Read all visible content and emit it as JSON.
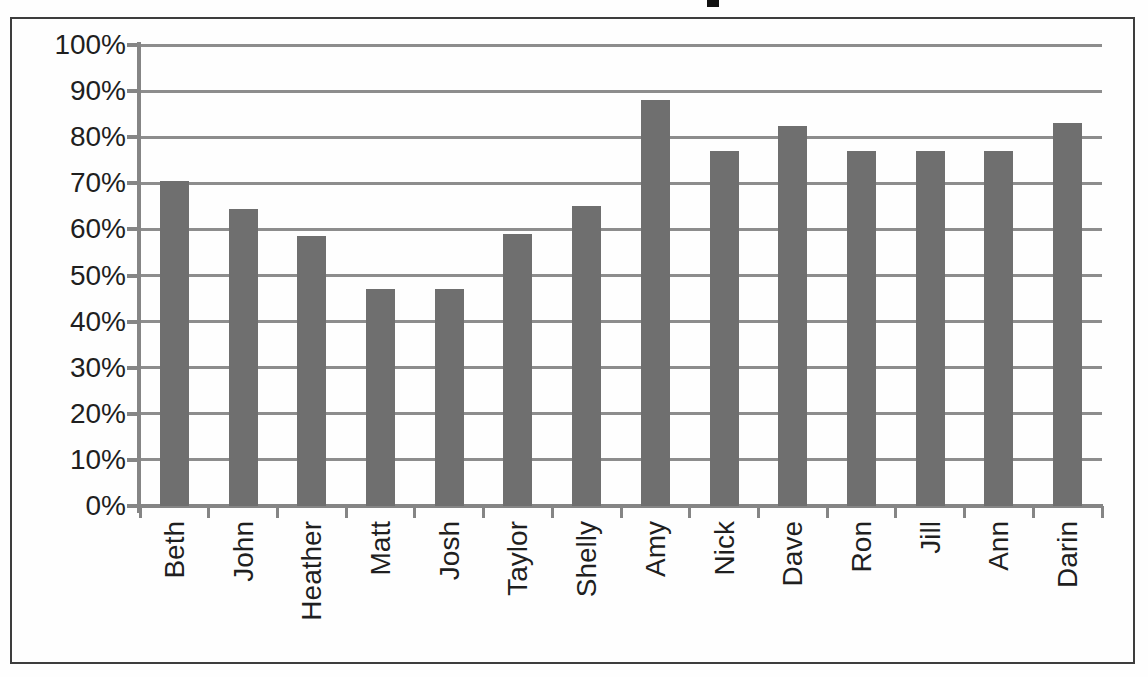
{
  "chart_data": {
    "type": "bar",
    "title": "",
    "title_note": "title cropped out of screenshot; only a letter descender fragment visible at top",
    "categories": [
      "Beth",
      "John",
      "Heather",
      "Matt",
      "Josh",
      "Taylor",
      "Shelly",
      "Amy",
      "Nick",
      "Dave",
      "Ron",
      "Jill",
      "Ann",
      "Darin"
    ],
    "values": [
      70.5,
      64.5,
      58.5,
      47,
      47,
      59,
      65,
      88,
      77,
      82.5,
      77,
      77,
      77,
      83
    ],
    "xlabel": "",
    "ylabel": "",
    "ylim": [
      0,
      100
    ],
    "ytick_step": 10,
    "yticks": [
      "0%",
      "10%",
      "20%",
      "30%",
      "40%",
      "50%",
      "60%",
      "70%",
      "80%",
      "90%",
      "100%"
    ],
    "grid": true,
    "legend": "none",
    "colors": {
      "bar": "#6f6f6f",
      "gridline": "#8d8d8d",
      "axis": "#858585",
      "text": "#1f1f1f",
      "frame_border": "#3d3d3d",
      "title_fragment": "#111111"
    }
  }
}
